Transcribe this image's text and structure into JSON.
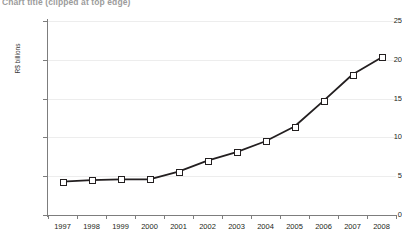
{
  "chart_data": {
    "type": "line",
    "title": "Chart title (clipped at top edge)",
    "xlabel": "",
    "ylabel": "R$ billions",
    "categories": [
      "1997",
      "1998",
      "1999",
      "2000",
      "2001",
      "2002",
      "2003",
      "2004",
      "2005",
      "2006",
      "2007",
      "2008"
    ],
    "values": [
      4.3,
      4.5,
      4.6,
      4.6,
      5.6,
      7.0,
      8.1,
      9.5,
      11.4,
      14.7,
      18.1,
      20.3
    ],
    "ylim": [
      0,
      25
    ],
    "yticks": [
      0,
      5,
      10,
      15,
      20,
      25
    ],
    "ytick_labels": [
      "0",
      "5",
      "10",
      "15",
      "20",
      "25"
    ],
    "grid": true,
    "grid_axis": "y",
    "legend": false,
    "marker": "square",
    "line_color": "#231f20",
    "marker_face_color": "#ffffff",
    "marker_edge_color": "#231f20",
    "grid_color": "#ededed",
    "axis_color": "#7d7d7d"
  }
}
